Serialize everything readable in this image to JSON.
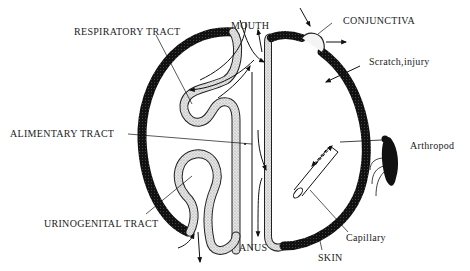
{
  "diagram": {
    "type": "anatomical schematic",
    "labels": {
      "respiratory_tract": "RESPIRATORY TRACT",
      "mouth": "MOUTH",
      "conjunctiva": "CONJUNCTIVA",
      "scratch_injury": "Scratch,injury",
      "alimentary_tract": "ALIMENTARY TRACT",
      "arthropod": "Arthropod",
      "urinogenital_tract": "URINOGENITAL TRACT",
      "anus": "ANUS",
      "capillary": "Capillary",
      "skin": "SKIN"
    },
    "caption_partial": "Fig. ... (cut off, illegible)",
    "colors": {
      "skin": "#1a1a1a",
      "mucosa": "#d8d8d8",
      "ink": "#111111"
    }
  }
}
